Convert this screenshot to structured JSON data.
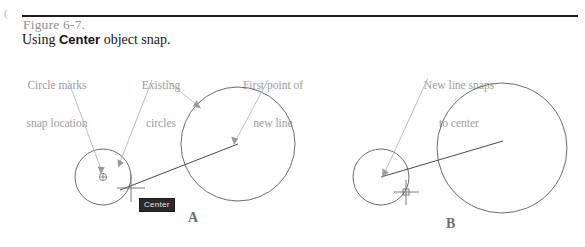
{
  "page": {
    "corner_mark": "(",
    "background_color": "#ffffff"
  },
  "header": {
    "figure_number": "Figure 6-7.",
    "figure_number_color": "#8d8d8d",
    "title_prefix": "Using ",
    "title_emphasis": "Center",
    "title_suffix": " object snap.",
    "rule_color": "#1c1c1c"
  },
  "callouts": [
    {
      "id": "circle-marks-snap-location",
      "line1": "Circle marks",
      "line2": "snap location"
    },
    {
      "id": "existing-circles",
      "line1": "Existing",
      "line2": "circles"
    },
    {
      "id": "first-point-of-new-line",
      "line1": "First point of",
      "line2": "new line"
    },
    {
      "id": "new-line-snaps-to-center",
      "line1": "New line snaps",
      "line2": "to center"
    }
  ],
  "panels": [
    {
      "id": "panel-a",
      "letter": "A",
      "tooltip": "Center",
      "tooltip_bg": "#2a2a2a",
      "tooltip_fg": "#e8e8e8",
      "description": "Center object snap marker shown on small circle while first point of new line is placed in large circle"
    },
    {
      "id": "panel-b",
      "letter": "B",
      "tooltip": "",
      "description": "New line endpoint snapped exactly to the center of the small circle"
    }
  ],
  "colors": {
    "geometry_stroke": "#6b6b6b",
    "line_stroke": "#4a4a4a",
    "leader_stroke": "#b5b5b5",
    "callout_text": "#9b9b9b",
    "title_text": "#151515"
  }
}
